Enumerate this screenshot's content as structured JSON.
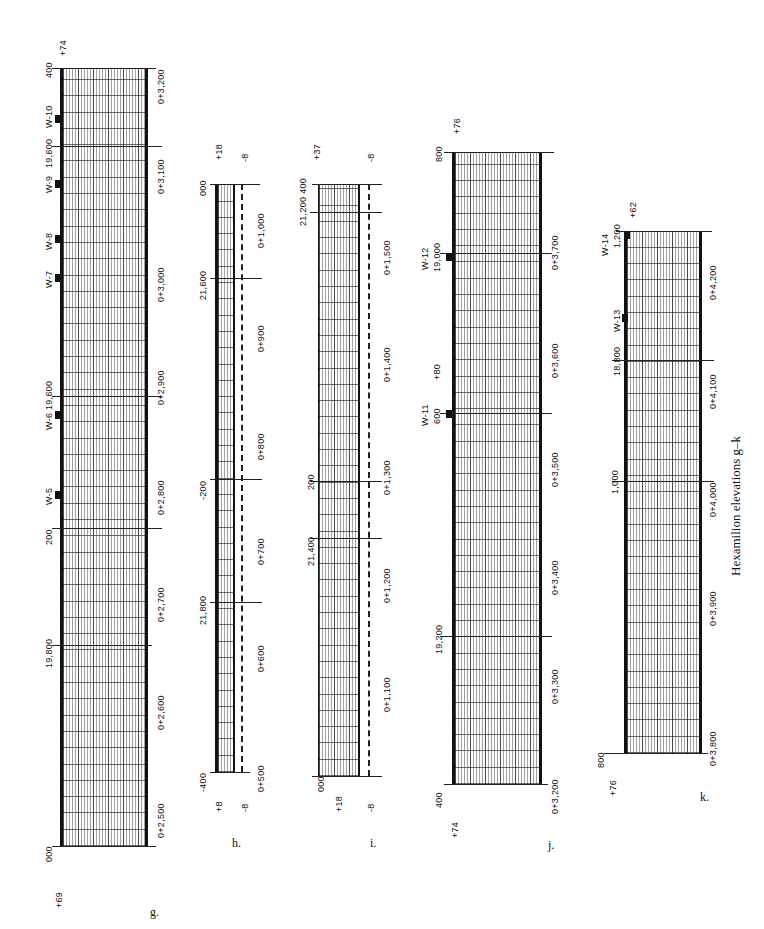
{
  "caption": "Hexamilion elevations g–k",
  "panels": {
    "g": {
      "label": "g.",
      "left_elev": "+69",
      "right_elev": "+74",
      "top_tick": "400",
      "bottom_tick": "000",
      "grid_ticks": [
        "200",
        "19,600",
        "19,400",
        "19,800"
      ],
      "stations": [
        "0+3,200",
        "0+3,100",
        "0+3,000",
        "0+2,900",
        "0+2,800",
        "0+2,700",
        "0+2,600",
        "0+2,500"
      ],
      "walls": [
        "W-10",
        "W-9",
        "W-8",
        "W-7",
        "W-6",
        "W-5"
      ]
    },
    "h": {
      "label": "h.",
      "top_elev": "+18",
      "top_elev2": "-8",
      "bottom_elev": "+8",
      "bottom_elev2": "-8",
      "top_tick": "000",
      "bottom_tick": "-400",
      "grid_ticks": [
        "21,600",
        "-200",
        "21,800"
      ],
      "stations": [
        "0+1,000",
        "0+900",
        "0+800",
        "0+700",
        "0+600",
        "0+500"
      ]
    },
    "i": {
      "label": "i.",
      "top_elev": "+37",
      "top_elev2": "-8",
      "bottom_elev": "+18",
      "bottom_elev2": "-8",
      "top_tick": "21,200  400",
      "bottom_tick": "000",
      "grid_ticks": [
        "200",
        "21,400"
      ],
      "stations": [
        "0+1,500",
        "0+1,400",
        "0+1,300",
        "0+1,200",
        "0+1,100"
      ]
    },
    "j": {
      "label": "j.",
      "top_elev": "+76",
      "bottom_elev": "+74",
      "top_tick": "800",
      "bottom_tick": "400",
      "grid_ticks": [
        "19,000",
        "600",
        "19,200"
      ],
      "stations": [
        "0+3,700",
        "0+3,600",
        "0+3,500",
        "0+3,400",
        "0+3,300",
        "0+3,200"
      ],
      "walls": [
        "W-12",
        "W-11"
      ],
      "spot_elev": "+80"
    },
    "k": {
      "label": "k.",
      "top_elev": "+62",
      "bottom_elev": "+76",
      "top_tick": "1,200",
      "bottom_tick": "800",
      "grid_ticks": [
        "18,800",
        "1,000"
      ],
      "stations": [
        "0+4,200",
        "0+4,100",
        "0+4,000",
        "0+3,900",
        "0+3,800"
      ],
      "walls": [
        "W-14",
        "W-13"
      ]
    }
  }
}
